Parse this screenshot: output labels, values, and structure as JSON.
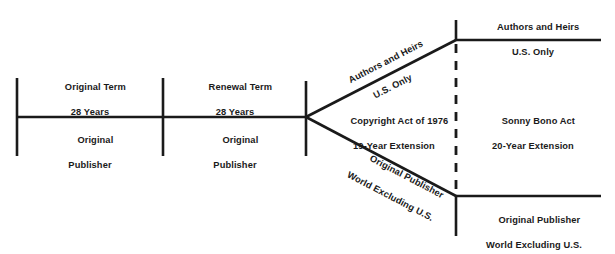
{
  "diagram": {
    "background_color": "#ffffff",
    "line_color": "#1a1a1a",
    "text_color": "#1a1a1a",
    "segments": {
      "original_term": {
        "above_line1": "Original Term",
        "above_line2": "28 Years",
        "below_line1": "Original",
        "below_line2": "Publisher"
      },
      "renewal_term": {
        "above_line1": "Renewal Term",
        "above_line2": "28 Years",
        "below_line1": "Original",
        "below_line2": "Publisher"
      },
      "act_1976": {
        "line1": "Copyright Act of 1976",
        "line2": "19-Year Extension"
      },
      "sonny_bono": {
        "line1": "Sonny Bono Act",
        "line2": "20-Year Extension"
      }
    },
    "branch_upper": {
      "line1": "Authors and Heirs",
      "line2": "U.S. Only"
    },
    "branch_lower": {
      "line1": "Original Publisher",
      "line2": "World Excluding U.S."
    },
    "terminal_upper": {
      "line1": "Authors and Heirs",
      "line2": "U.S. Only"
    },
    "terminal_lower": {
      "line1": "Original Publisher",
      "line2": "World Excluding U.S."
    }
  }
}
